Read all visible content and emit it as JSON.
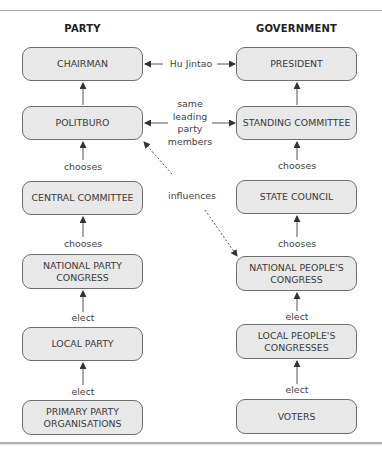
{
  "columns": {
    "party": {
      "title": "PARTY"
    },
    "government": {
      "title": "GOVERNMENT"
    }
  },
  "party_boxes": [
    {
      "label": "CHAIRMAN"
    },
    {
      "label": "POLITBURO"
    },
    {
      "label": "CENTRAL COMMITTEE"
    },
    {
      "label": "NATIONAL PARTY\nCONGRESS"
    },
    {
      "label": "LOCAL PARTY"
    },
    {
      "label": "PRIMARY PARTY\nORGANISATIONS"
    }
  ],
  "government_boxes": [
    {
      "label": "PRESIDENT"
    },
    {
      "label": "STANDING COMMITTEE"
    },
    {
      "label": "STATE COUNCIL"
    },
    {
      "label": "NATIONAL PEOPLE'S\nCONGRESS"
    },
    {
      "label": "LOCAL PEOPLE'S\nCONGRESSES"
    },
    {
      "label": "VOTERS"
    }
  ],
  "party_links": [
    {
      "label": ""
    },
    {
      "label": "chooses"
    },
    {
      "label": "chooses"
    },
    {
      "label": "elect"
    },
    {
      "label": "elect"
    }
  ],
  "government_links": [
    {
      "label": ""
    },
    {
      "label": "chooses"
    },
    {
      "label": "chooses"
    },
    {
      "label": "elect"
    },
    {
      "label": "elect"
    }
  ],
  "cross_links": {
    "top": "Hu Jintao",
    "second": "same\nleading\nparty\nmembers",
    "influence": "influences"
  },
  "colors": {
    "box_fill": "#e8e8e8",
    "box_border": "#6e6e6e",
    "arrow": "#333333",
    "text": "#3a3a3a"
  }
}
